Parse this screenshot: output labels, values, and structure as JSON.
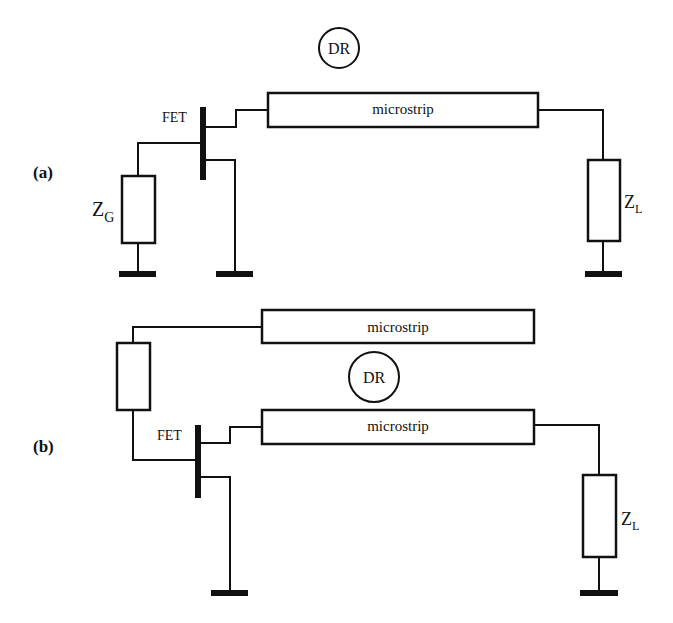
{
  "diagram": {
    "colors": {
      "line": "#111111",
      "background": "#ffffff"
    },
    "panel_a": {
      "label": "(a)",
      "resonator": "DR",
      "transistor": "FET",
      "line": "microstrip",
      "gate_impedance": {
        "main": "Z",
        "sub": "G"
      },
      "load_impedance": {
        "main": "Z",
        "sub": "L"
      }
    },
    "panel_b": {
      "label": "(b)",
      "resonator": "DR",
      "transistor": "FET",
      "line_top": "microstrip",
      "line_bottom": "microstrip",
      "load_impedance": {
        "main": "Z",
        "sub": "L"
      }
    }
  }
}
